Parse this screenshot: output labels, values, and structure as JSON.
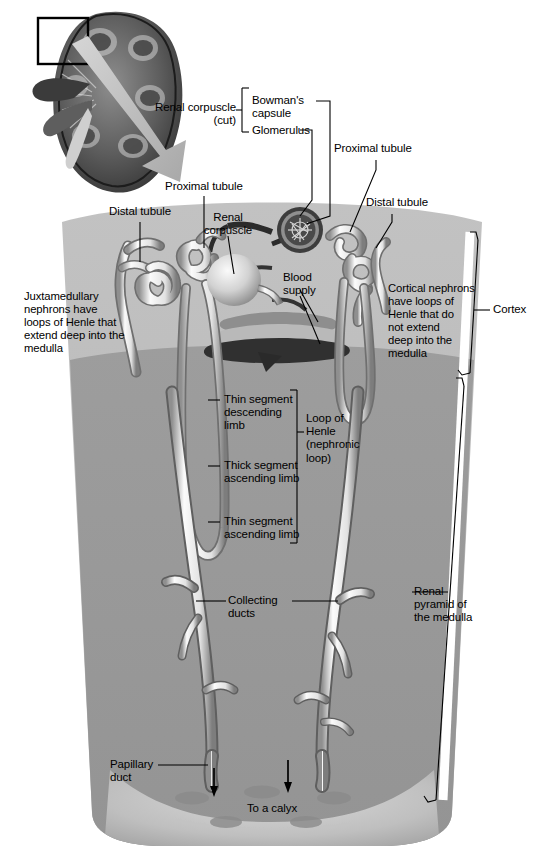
{
  "figure": {
    "inset_label": "kidney-frontal-section-with-detail-box"
  },
  "labels": {
    "renal_corpuscle_cut": "Renal corpuscle\n(cut)",
    "bowmans_capsule": "Bowman's\ncapsule",
    "glomerulus": "Glomerulus",
    "proximal_tubule_left": "Proximal tubule",
    "proximal_tubule_right": "Proximal tubule",
    "distal_tubule_left": "Distal tubule",
    "distal_tubule_right": "Distal tubule",
    "renal_corpuscle": "Renal\ncorpuscle",
    "blood_supply": "Blood\nsupply",
    "juxtamedullary": "Juxtamedullary\nnephrons have\nloops of Henle that\nextend deep into the\nmedulla",
    "cortical": "Cortical nephrons\nhave loops of\nHenle that do\nnot extend\ndeep into the\nmedulla",
    "thin_descending": "Thin segment\ndescending\nlimb",
    "thick_ascending": "Thick segment\nascending limb",
    "thin_ascending": "Thin segment\nascending limb",
    "loop_of_henle": "Loop of\nHenle\n(nephronic\nloop)",
    "collecting_ducts": "Collecting\nducts",
    "papillary_duct": "Papillary\nduct",
    "to_a_calyx": "To a calyx",
    "cortex": "Cortex",
    "renal_pyramid": "Renal\npyramid of\nthe medulla"
  },
  "colors": {
    "background": "#ffffff",
    "cortex_fill": "#b9b9b9",
    "medulla_fill": "#9b9b9b",
    "papilla_fill": "#c8c8c8",
    "tubule_light": "#f2f2f2",
    "tubule_shadow": "#6d6d6d",
    "vessel_dark": "#2e2e2e",
    "leader_line": "#000000",
    "arrow_fill": "#bdbdbd",
    "kidney_dark": "#4a4a4a"
  }
}
